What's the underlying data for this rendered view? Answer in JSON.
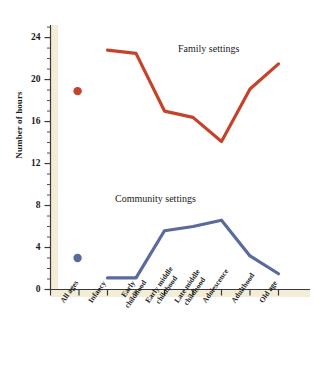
{
  "chart_data": {
    "type": "line",
    "title": "",
    "xlabel": "",
    "ylabel": "Number of hours",
    "ylim": [
      0,
      25.2
    ],
    "yticks": [
      0,
      4,
      8,
      12,
      16,
      20,
      24
    ],
    "minor_tick_step": 1,
    "grid": false,
    "legend_position": "inline-annotation",
    "categories": [
      "All ages",
      "Infancy",
      "Early childhood",
      "Early middle childhood",
      "Late middle childhood",
      "Adolescence",
      "Adulthood",
      "Old age"
    ],
    "series": [
      {
        "name": "Family settings",
        "color": "#c4432a",
        "marker_points": [
          {
            "category": "All ages",
            "value": 18.9
          }
        ],
        "line_points": [
          {
            "category": "Early childhood",
            "value": 22.8
          },
          {
            "category": "Early middle childhood",
            "value": 22.5
          },
          {
            "category": "Late middle childhood",
            "value": 17.0
          },
          {
            "category": "Adolescence",
            "value": 16.4
          },
          {
            "category": "Adulthood",
            "value": 14.1
          },
          {
            "category": "Old age",
            "value": 19.1
          },
          {
            "category": "Beyond",
            "value": 21.5
          }
        ]
      },
      {
        "name": "Community settings",
        "color": "#5a6a9e",
        "marker_points": [
          {
            "category": "All ages",
            "value": 3.0
          }
        ],
        "line_points": [
          {
            "category": "Early childhood",
            "value": 1.1
          },
          {
            "category": "Early middle childhood",
            "value": 1.1
          },
          {
            "category": "Late middle childhood",
            "value": 5.6
          },
          {
            "category": "Adolescence",
            "value": 6.0
          },
          {
            "category": "Adulthood",
            "value": 6.6
          },
          {
            "category": "Old age",
            "value": 3.2
          },
          {
            "category": "Beyond",
            "value": 1.5
          }
        ]
      }
    ],
    "annotations": [
      {
        "text": "Family settings",
        "x": 178,
        "y": 43
      },
      {
        "text": "Community settings",
        "x": 115,
        "y": 193
      }
    ]
  },
  "axis": {
    "y_title": "Number of hours",
    "y_tick_labels": [
      "24",
      "20",
      "16",
      "12",
      "8",
      "4",
      "0"
    ],
    "x_tick_labels": [
      {
        "line1": "All ages",
        "line2": ""
      },
      {
        "line1": "Infancy",
        "line2": ""
      },
      {
        "line1": "Early",
        "line2": "childhood"
      },
      {
        "line1": "Early middle",
        "line2": "childhood"
      },
      {
        "line1": "Late middle",
        "line2": "childhood"
      },
      {
        "line1": "Adolescence",
        "line2": ""
      },
      {
        "line1": "Adulthood",
        "line2": ""
      },
      {
        "line1": "Old age",
        "line2": ""
      }
    ]
  },
  "colors": {
    "family_line": "#c4432a",
    "community_line": "#5a6a9e",
    "axis_band": "#f3ecd7",
    "axis_line": "#3a3a3a",
    "background": "#ffffff",
    "text": "#1a1a1a"
  }
}
